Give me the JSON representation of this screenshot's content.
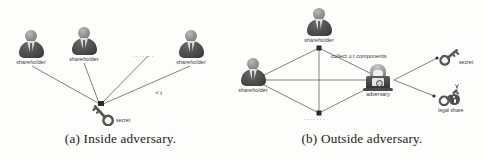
{
  "figure": {
    "type": "two-panel-diagram",
    "background": "#fdfdfc",
    "line_color": "#4a4a4a",
    "panels": [
      {
        "id": "a",
        "caption": "(a) Inside adversary.",
        "actors": [
          {
            "name": "shareholder-1",
            "label": "shareholder",
            "x": 16,
            "y": 30
          },
          {
            "name": "shareholder-2",
            "label": "shareholder",
            "x": 69,
            "y": 27
          },
          {
            "name": "shareholder-3",
            "label": "shareholder",
            "x": 176,
            "y": 30
          }
        ],
        "ellipsis": "·······",
        "threshold_label": "< t",
        "secret": {
          "icon": "key-icon",
          "label": "secret"
        }
      },
      {
        "id": "b",
        "caption": "(b) Outside adversary.",
        "actors": [
          {
            "name": "shareholder-top",
            "label": "shareholder",
            "x": 304,
            "y": 8
          },
          {
            "name": "shareholder-left",
            "label": "shareholder",
            "x": 238,
            "y": 58
          }
        ],
        "ellipsis": "·······",
        "adversary": {
          "icon": "hacker-icon",
          "label": "adversary"
        },
        "collect_label": "collect ≥ t components",
        "outputs": [
          {
            "name": "secret-key",
            "icon": "key-icon",
            "label": "secret"
          },
          {
            "name": "legal-share-key",
            "icon": "broken-key-icon",
            "label": "legal share"
          }
        ]
      }
    ]
  }
}
